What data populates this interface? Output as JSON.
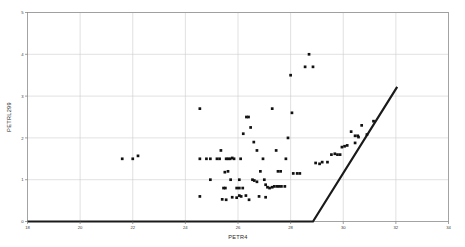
{
  "chart_data": {
    "type": "scatter",
    "title": "",
    "xlabel": "PETR4",
    "ylabel": "PETRL299",
    "xlim": [
      18,
      34
    ],
    "ylim": [
      0,
      5
    ],
    "xticks": [
      18,
      20,
      22,
      24,
      26,
      28,
      30,
      32,
      34
    ],
    "yticks": [
      0,
      1,
      2,
      3,
      4,
      5
    ],
    "grid": true,
    "legend": null,
    "marker_color": "#111111",
    "line_color": "#1a1a1a",
    "grid_color": "#cccccc",
    "frame_color": "#9a9a9a",
    "series": [
      {
        "name": "PETRL299 observed",
        "type": "scatter",
        "marker": "square",
        "points": [
          [
            21.6,
            1.5
          ],
          [
            22.0,
            1.5
          ],
          [
            22.2,
            1.57
          ],
          [
            24.55,
            2.7
          ],
          [
            24.55,
            1.5
          ],
          [
            24.55,
            0.6
          ],
          [
            24.95,
            1.5
          ],
          [
            24.95,
            1.0
          ],
          [
            25.35,
            1.7
          ],
          [
            25.55,
            1.5
          ],
          [
            25.62,
            1.5
          ],
          [
            25.7,
            1.5
          ],
          [
            25.78,
            1.52
          ],
          [
            25.85,
            1.5
          ],
          [
            25.62,
            1.2
          ],
          [
            25.5,
            1.18
          ],
          [
            25.45,
            0.8
          ],
          [
            25.52,
            0.8
          ],
          [
            25.4,
            0.53
          ],
          [
            25.55,
            0.52
          ],
          [
            25.72,
            1.0
          ],
          [
            25.78,
            0.58
          ],
          [
            25.95,
            0.57
          ],
          [
            26.05,
            0.62
          ],
          [
            26.12,
            0.6
          ],
          [
            26.3,
            0.62
          ],
          [
            26.05,
            0.8
          ],
          [
            26.18,
            0.8
          ],
          [
            26.1,
            1.5
          ],
          [
            26.2,
            2.1
          ],
          [
            26.32,
            2.5
          ],
          [
            26.4,
            2.5
          ],
          [
            26.48,
            2.25
          ],
          [
            26.6,
            1.9
          ],
          [
            26.72,
            1.7
          ],
          [
            26.55,
            1.0
          ],
          [
            26.62,
            0.98
          ],
          [
            26.72,
            0.95
          ],
          [
            26.85,
            1.2
          ],
          [
            27.0,
            1.0
          ],
          [
            27.05,
            0.88
          ],
          [
            27.12,
            0.82
          ],
          [
            27.2,
            0.8
          ],
          [
            27.3,
            0.82
          ],
          [
            27.38,
            0.84
          ],
          [
            27.48,
            0.84
          ],
          [
            27.56,
            0.84
          ],
          [
            27.65,
            0.84
          ],
          [
            27.78,
            0.84
          ],
          [
            27.3,
            2.7
          ],
          [
            27.45,
            1.7
          ],
          [
            27.52,
            1.2
          ],
          [
            27.82,
            1.5
          ],
          [
            27.9,
            2.0
          ],
          [
            28.0,
            3.5
          ],
          [
            28.05,
            2.6
          ],
          [
            28.1,
            1.15
          ],
          [
            28.25,
            1.15
          ],
          [
            28.55,
            3.7
          ],
          [
            28.7,
            4.0
          ],
          [
            28.85,
            3.7
          ],
          [
            28.95,
            1.4
          ],
          [
            29.1,
            1.38
          ],
          [
            29.2,
            1.42
          ],
          [
            29.55,
            1.6
          ],
          [
            29.68,
            1.62
          ],
          [
            29.78,
            1.6
          ],
          [
            29.88,
            1.6
          ],
          [
            29.95,
            1.78
          ],
          [
            30.05,
            1.8
          ],
          [
            30.15,
            1.82
          ],
          [
            30.3,
            2.15
          ],
          [
            30.45,
            2.05
          ],
          [
            30.55,
            2.05
          ],
          [
            30.58,
            2.02
          ],
          [
            30.45,
            1.88
          ],
          [
            30.7,
            2.3
          ],
          [
            31.15,
            2.4
          ],
          [
            26.95,
            1.5
          ],
          [
            26.05,
            1.0
          ],
          [
            25.95,
            0.8
          ],
          [
            27.62,
            1.2
          ],
          [
            24.8,
            1.5
          ],
          [
            25.2,
            1.5
          ],
          [
            25.3,
            1.5
          ],
          [
            26.8,
            0.6
          ],
          [
            27.05,
            0.58
          ],
          [
            26.42,
            0.52
          ],
          [
            28.35,
            1.15
          ],
          [
            29.4,
            1.42
          ],
          [
            30.9,
            2.08
          ]
        ]
      },
      {
        "name": "payoff line",
        "type": "line",
        "points": [
          [
            18.0,
            0.0
          ],
          [
            28.85,
            0.0
          ],
          [
            32.05,
            3.22
          ]
        ]
      }
    ]
  }
}
